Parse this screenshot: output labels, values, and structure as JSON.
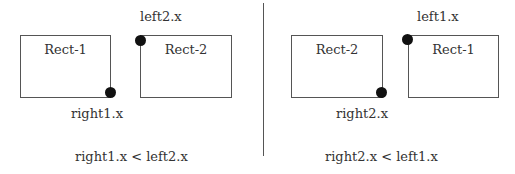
{
  "diagram": {
    "left_panel": {
      "rect_a": {
        "label": "Rect-1"
      },
      "rect_b": {
        "label": "Rect-2"
      },
      "top_label": "left2.x",
      "bottom_label": "right1.x",
      "condition": "right1.x < left2.x"
    },
    "right_panel": {
      "rect_a": {
        "label": "Rect-2"
      },
      "rect_b": {
        "label": "Rect-1"
      },
      "top_label": "left1.x",
      "bottom_label": "right2.x",
      "condition": "right2.x < left1.x"
    },
    "colors": {
      "stroke": "#555555",
      "dot": "#111111",
      "text": "#333333"
    }
  }
}
